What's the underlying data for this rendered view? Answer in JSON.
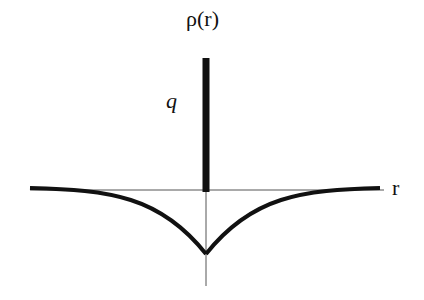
{
  "diagram": {
    "y_axis_label": "ρ(r)",
    "x_axis_label": "r",
    "spike_label": "q",
    "colors": {
      "stroke": "#111111",
      "axis": "#555555",
      "background": "#ffffff"
    }
  }
}
